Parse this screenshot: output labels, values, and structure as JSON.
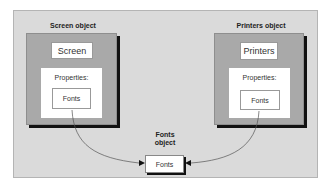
{
  "diagram": {
    "screen": {
      "title": "Screen object",
      "name": "Screen",
      "properties_label": "Properties:",
      "property": "Fonts"
    },
    "printers": {
      "title": "Printers object",
      "name": "Printers",
      "properties_label": "Properties:",
      "property": "Fonts"
    },
    "fonts": {
      "title_line1": "Fonts",
      "title_line2": "object",
      "name": "Fonts"
    },
    "colors": {
      "panel": "#dadada",
      "object_fill": "#a9a9a9",
      "shadow": "#111111",
      "connector": "#555555"
    }
  }
}
